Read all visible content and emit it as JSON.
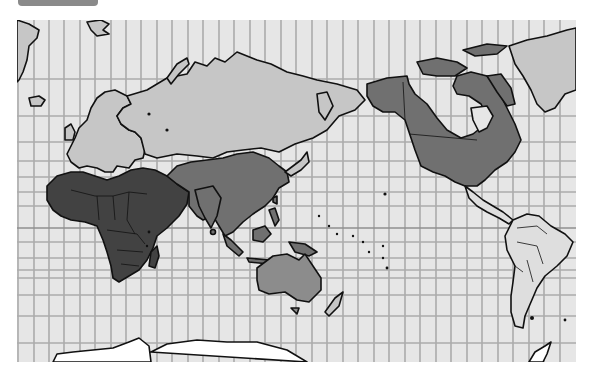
{
  "figure": {
    "type": "world-map",
    "projection": "Mercator (Pacific-centered)",
    "label_tab": ""
  },
  "map": {
    "background_color": "#e6e6e6",
    "grid_color": "#ababab",
    "outline_color": "#111111",
    "regions": [
      {
        "name": "Africa",
        "shade": "dark",
        "color": "#424242"
      },
      {
        "name": "Middle East",
        "shade": "dark",
        "color": "#424242"
      },
      {
        "name": "South & Southeast Asia",
        "shade": "mid",
        "color": "#707070"
      },
      {
        "name": "China",
        "shade": "mid",
        "color": "#707070"
      },
      {
        "name": "Central Asia",
        "shade": "mid",
        "color": "#707070"
      },
      {
        "name": "Russia",
        "shade": "light",
        "color": "#c6c6c6"
      },
      {
        "name": "Europe",
        "shade": "light",
        "color": "#c6c6c6"
      },
      {
        "name": "Australia",
        "shade": "mid2",
        "color": "#8c8c8c"
      },
      {
        "name": "North America",
        "shade": "mid",
        "color": "#707070"
      },
      {
        "name": "Greenland",
        "shade": "light",
        "color": "#c6c6c6"
      },
      {
        "name": "Latin America",
        "shade": "lighter",
        "color": "#dedede"
      },
      {
        "name": "Antarctica",
        "shade": "white",
        "color": "#ffffff"
      }
    ]
  }
}
